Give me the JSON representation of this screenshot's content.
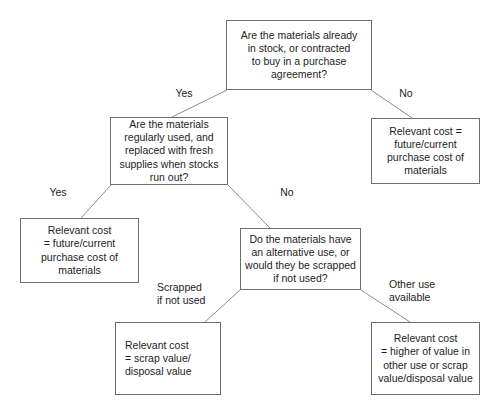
{
  "diagram": {
    "type": "decision-tree",
    "nodes": {
      "q_in_stock": {
        "kind": "question",
        "text": "Are the materials already\nin stock, or contracted\nto buy in a purchase\nagreement?"
      },
      "r_not_in_stock": {
        "kind": "outcome",
        "text": "Relevant cost =\nfuture/current\npurchase cost of\nmaterials"
      },
      "q_regularly_used": {
        "kind": "question",
        "text": "Are the materials\nregularly used, and\nreplaced with fresh\nsupplies when stocks\nrun out?"
      },
      "r_regularly_used": {
        "kind": "outcome",
        "text": "Relevant cost\n= future/current\npurchase cost of\nmaterials"
      },
      "q_alternative_use": {
        "kind": "question",
        "text": "Do the materials have\nan alternative use, or\nwould they be scrapped\nif not used?"
      },
      "r_scrapped": {
        "kind": "outcome",
        "text": "Relevant cost\n= scrap value/\ndisposal value"
      },
      "r_other_use": {
        "kind": "outcome",
        "text": "Relevant cost\n= higher of value in\nother use or scrap\nvalue/disposal value"
      }
    },
    "edges": [
      {
        "id": "e_instock_yes",
        "from": "q_in_stock",
        "to": "q_regularly_used",
        "label": "Yes"
      },
      {
        "id": "e_instock_no",
        "from": "q_in_stock",
        "to": "r_not_in_stock",
        "label": "No"
      },
      {
        "id": "e_regular_yes",
        "from": "q_regularly_used",
        "to": "r_regularly_used",
        "label": "Yes"
      },
      {
        "id": "e_regular_no",
        "from": "q_regularly_used",
        "to": "q_alternative_use",
        "label": "No"
      },
      {
        "id": "e_alt_scrapped",
        "from": "q_alternative_use",
        "to": "r_scrapped",
        "label": "Scrapped\nif not used"
      },
      {
        "id": "e_alt_other_use",
        "from": "q_alternative_use",
        "to": "r_other_use",
        "label": "Other use\navailable"
      }
    ],
    "colors": {
      "box_border": "#6d6f72",
      "connector": "#8a8c8f",
      "text": "#1d1d1d",
      "background": "#ffffff"
    }
  }
}
